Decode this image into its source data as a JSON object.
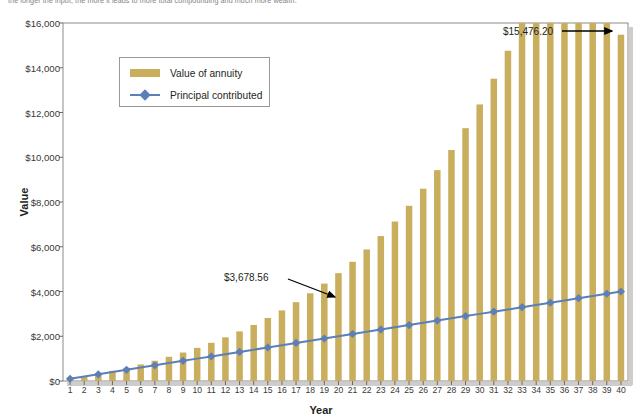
{
  "caption": "the longer the input, the more it leads to more total compounding and much more wealth.",
  "chart_data": {
    "type": "bar",
    "title": "",
    "xlabel": "Year",
    "ylabel": "Value",
    "ylim": [
      0,
      16000
    ],
    "ytick_values": [
      0,
      2000,
      4000,
      6000,
      8000,
      10000,
      12000,
      14000,
      16000
    ],
    "ytick_labels": [
      "$0",
      "$2,000",
      "$4,000",
      "$6,000",
      "$8,000",
      "$10,000",
      "$12,000",
      "$14,000",
      "$16,000"
    ],
    "grid": false,
    "legend_position": "upper-left-inside",
    "categories": [
      1,
      2,
      3,
      4,
      5,
      6,
      7,
      8,
      9,
      10,
      11,
      12,
      13,
      14,
      15,
      16,
      17,
      18,
      19,
      20,
      21,
      22,
      23,
      24,
      25,
      26,
      27,
      28,
      29,
      30,
      31,
      32,
      33,
      34,
      35,
      36,
      37,
      38,
      39,
      40
    ],
    "series": [
      {
        "name": "Value of annuity",
        "type": "bar",
        "color": "#c9ae5d",
        "values": [
          100,
          208,
          326,
          453,
          591,
          741,
          904,
          1081,
          1272,
          1480,
          1706,
          1951,
          2216,
          2504,
          2816,
          3155,
          3522,
          3920,
          4352,
          4820,
          5328,
          5879,
          6477,
          7126,
          7830,
          8594,
          9423,
          10323,
          11300,
          12360,
          13511,
          14761,
          16119,
          17593,
          19196,
          20937,
          22831,
          24890,
          27130,
          15476.2
        ]
      },
      {
        "name": "Principal contributed",
        "type": "line",
        "color": "#5b7fb9",
        "marker": "diamond",
        "values": [
          100,
          200,
          300,
          400,
          500,
          600,
          700,
          800,
          900,
          1000,
          1100,
          1200,
          1300,
          1400,
          1500,
          1600,
          1700,
          1800,
          1900,
          2000,
          2100,
          2200,
          2300,
          2400,
          2500,
          2600,
          2700,
          2800,
          2900,
          3000,
          3100,
          3200,
          3300,
          3400,
          3500,
          3600,
          3700,
          3800,
          3900,
          4000
        ]
      }
    ],
    "annotations": [
      {
        "name": "final-value-annotation",
        "label": "$15,476.20",
        "target_year": 40,
        "target_value": 15476.2
      },
      {
        "name": "midpoint-value-annotation",
        "label": "$3,678.56",
        "target_year": 21,
        "target_value": 3678.56
      }
    ]
  }
}
